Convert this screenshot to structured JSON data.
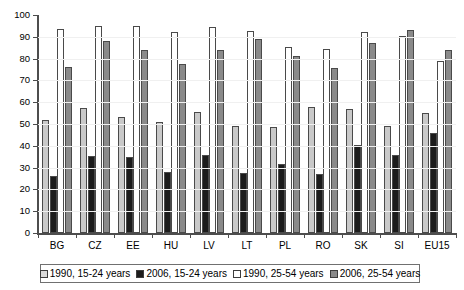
{
  "chart_data": {
    "type": "bar",
    "title": "",
    "subtitle": "",
    "xlabel": "",
    "ylabel": "",
    "ylim": [
      0,
      100
    ],
    "yticks": [
      0,
      10,
      20,
      30,
      40,
      50,
      60,
      70,
      80,
      90,
      100
    ],
    "grid": false,
    "legend_position": "bottom",
    "categories": [
      "BG",
      "CZ",
      "EE",
      "HU",
      "LV",
      "LT",
      "PL",
      "RO",
      "SK",
      "SI",
      "EU15"
    ],
    "series": [
      {
        "name": "1990, 15-24 years",
        "color": "#c9c9c9",
        "values": [
          52,
          57.5,
          53,
          51,
          55.5,
          49,
          48.5,
          58,
          57,
          49,
          55
        ]
      },
      {
        "name": "2006, 15-24 years",
        "color": "#1c1c1c",
        "values": [
          26,
          35.5,
          35,
          28,
          36,
          27.5,
          31.5,
          27,
          40.5,
          36,
          46
        ]
      },
      {
        "name": "1990, 25-54 years",
        "color": "#ffffff",
        "values": [
          93.5,
          95,
          95,
          92,
          94.5,
          92.5,
          85.5,
          84.5,
          92,
          90.5,
          79
        ]
      },
      {
        "name": "2006, 25-54 years",
        "color": "#8a8a8a",
        "values": [
          76,
          88,
          84,
          77.5,
          84,
          89,
          81,
          75.5,
          87,
          93,
          84
        ]
      }
    ]
  },
  "axis": {
    "tick_labels": [
      "100",
      "90",
      "80",
      "70",
      "60",
      "50",
      "40",
      "30",
      "20",
      "10",
      "0"
    ]
  },
  "legend": {
    "items": [
      {
        "label": "1990, 15-24 years",
        "swatch": "s1"
      },
      {
        "label": "2006, 15-24 years",
        "swatch": "s2"
      },
      {
        "label": "1990, 25-54 years",
        "swatch": "s3"
      },
      {
        "label": "2006, 25-54 years",
        "swatch": "s4"
      }
    ]
  }
}
